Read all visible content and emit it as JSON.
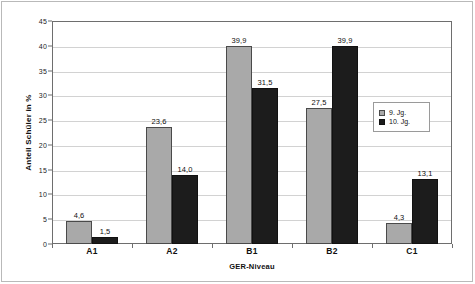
{
  "chart_data": {
    "type": "bar",
    "title": "",
    "xlabel": "GER-Niveau",
    "ylabel": "Anteil Schüler in %",
    "categories": [
      "A1",
      "A2",
      "B1",
      "B2",
      "C1"
    ],
    "ylim": [
      0,
      45
    ],
    "ytick_step": 5,
    "yticks": [
      "0",
      "5",
      "10",
      "15",
      "20",
      "25",
      "30",
      "35",
      "40",
      "45"
    ],
    "grid": true,
    "legend_position": "center-right",
    "series": [
      {
        "name": "9. Jg.",
        "color": "#a9a9a9",
        "values": [
          4.6,
          23.6,
          39.9,
          27.5,
          4.3
        ],
        "labels": [
          "4,6",
          "23,6",
          "39,9",
          "27,5",
          "4,3"
        ]
      },
      {
        "name": "10. Jg.",
        "color": "#1c1c1c",
        "values": [
          1.5,
          14.0,
          31.5,
          39.9,
          13.1
        ],
        "labels": [
          "1,5",
          "14,0",
          "31,5",
          "39,9",
          "13,1"
        ]
      }
    ]
  }
}
